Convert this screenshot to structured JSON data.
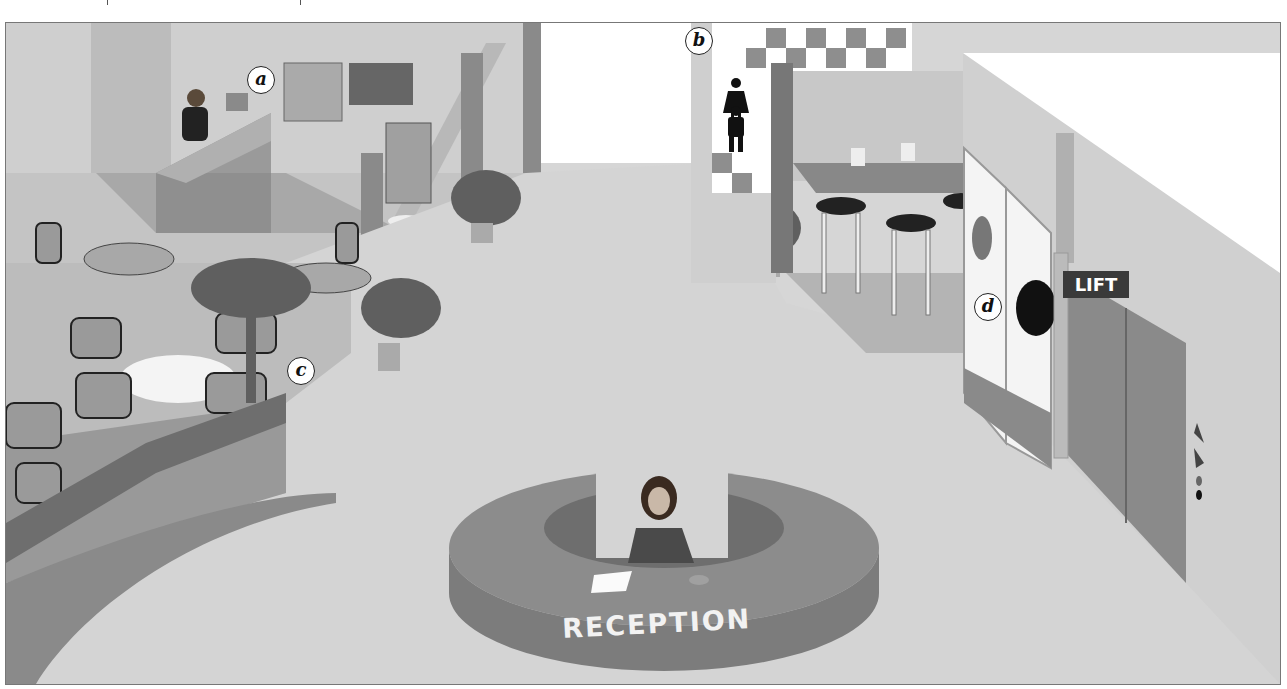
{
  "scene": {
    "title": "Hotel lobby illustration",
    "description": "Greyscale illustration of a hotel lobby with reception desk, café seating, restrooms, bar, telephones and lift"
  },
  "labels": {
    "a": "a",
    "b": "b",
    "c": "c",
    "d": "d"
  },
  "signs": {
    "reception": "RECEPTION",
    "lift": "LIFT"
  },
  "areas": [
    {
      "id": "a",
      "name": "Front desk / concierge with notice boards and brochure rack"
    },
    {
      "id": "b",
      "name": "Restrooms (female and male symbols)"
    },
    {
      "id": "c",
      "name": "Café / lounge seating with tables and chairs"
    },
    {
      "id": "d",
      "name": "Public telephones"
    },
    {
      "id": "lift",
      "name": "Lift (elevator)"
    },
    {
      "id": "reception",
      "name": "Circular reception desk with receptionist"
    }
  ],
  "colors": {
    "floor": "#d4d4d4",
    "wall": "#c8c8c8",
    "dark": "#7a7a7a",
    "desk": "#8c8c8c",
    "background": "#ffffff"
  }
}
